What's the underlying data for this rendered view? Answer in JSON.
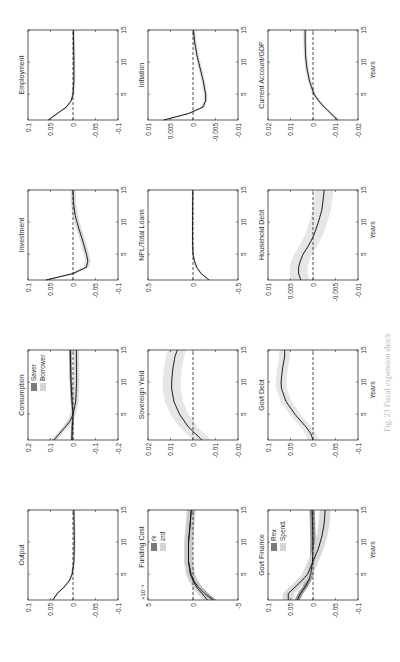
{
  "figure": {
    "caption": "Fig. 23  Fiscal expansion shock",
    "x_axis_label": "Years",
    "orientation": "rotated -90deg (landscape figure in portrait page)"
  },
  "chart_data": [
    {
      "type": "line",
      "title": "Output",
      "row": 0,
      "col": 0,
      "ylim": [
        -0.1,
        0.1
      ],
      "yticks": [
        "0.1",
        "0.05",
        "0",
        "-0.05",
        "-0.1"
      ],
      "xlim": [
        1,
        15
      ],
      "xticks": [
        "5",
        "10",
        "15"
      ],
      "series": [
        {
          "name": "Output",
          "x": [
            1,
            2,
            3,
            4,
            5,
            7,
            10,
            15
          ],
          "values": [
            0.045,
            0.035,
            0.02,
            0.008,
            0.002,
            -0.002,
            -0.003,
            -0.002
          ],
          "band": 0.003,
          "band_color": "#d8d8d8"
        }
      ]
    },
    {
      "type": "line",
      "title": "Consumption",
      "row": 0,
      "col": 1,
      "ylim": [
        -0.2,
        0.2
      ],
      "yticks": [
        "0.2",
        "0.1",
        "0",
        "-0.1",
        "-0.2"
      ],
      "xlim": [
        1,
        15
      ],
      "xticks": [
        "5",
        "10",
        "15"
      ],
      "legend": [
        {
          "label": "Saver",
          "color": "#7a7a7a"
        },
        {
          "label": "Borrower",
          "color": "#d4d4d4"
        }
      ],
      "series": [
        {
          "name": "Saver",
          "x": [
            1,
            3,
            5,
            8,
            11,
            15
          ],
          "values": [
            0.005,
            0.003,
            0.0,
            0.006,
            0.01,
            0.012
          ],
          "band": 0.006,
          "band_color": "#8a8a8a"
        },
        {
          "name": "Borrower",
          "x": [
            1,
            2,
            3,
            4,
            5,
            7,
            10,
            15
          ],
          "values": [
            0.085,
            0.06,
            0.035,
            0.012,
            0.0,
            -0.012,
            -0.016,
            -0.015
          ],
          "band": 0.012,
          "band_color": "#d4d4d4"
        }
      ]
    },
    {
      "type": "line",
      "title": "Investment",
      "row": 0,
      "col": 2,
      "ylim": [
        -0.1,
        0.1
      ],
      "yticks": [
        "0.1",
        "0.05",
        "0",
        "-0.05",
        "-0.1"
      ],
      "xlim": [
        1,
        15
      ],
      "xticks": [
        "5",
        "10",
        "15"
      ],
      "series": [
        {
          "name": "Investment",
          "x": [
            1,
            2,
            3,
            4,
            5,
            7,
            9,
            11,
            13,
            15
          ],
          "values": [
            0.06,
            0.0,
            -0.03,
            -0.033,
            -0.03,
            -0.022,
            -0.013,
            -0.005,
            -0.001,
            0.0
          ],
          "band": 0.006,
          "band_color": "#d8d8d8"
        }
      ]
    },
    {
      "type": "line",
      "title": "Employment",
      "row": 0,
      "col": 3,
      "ylim": [
        -0.1,
        0.1
      ],
      "yticks": [
        "0.1",
        "0.05",
        "0",
        "-0.05",
        "-0.1"
      ],
      "xlim": [
        1,
        15
      ],
      "xticks": [
        "5",
        "10",
        "15"
      ],
      "series": [
        {
          "name": "Employment",
          "x": [
            1,
            2,
            3,
            4,
            5,
            7,
            10,
            15
          ],
          "values": [
            0.055,
            0.035,
            0.015,
            0.004,
            0.0,
            -0.002,
            -0.002,
            -0.001
          ],
          "band": 0.003,
          "band_color": "#d8d8d8"
        }
      ]
    },
    {
      "type": "line",
      "title": "Funding Cost",
      "row": 1,
      "col": 0,
      "ylim": [
        -5,
        5
      ],
      "yticks": [
        "5",
        "0",
        "-5"
      ],
      "y_multiplier": "×10⁻³",
      "xlim": [
        1,
        15
      ],
      "xticks": [
        "5",
        "10",
        "15"
      ],
      "legend": [
        {
          "label": "rk",
          "color": "#7a7a7a"
        },
        {
          "label": "zrd",
          "color": "#d4d4d4"
        }
      ],
      "series": [
        {
          "name": "rk",
          "x": [
            1,
            2,
            3,
            4,
            5,
            7,
            10,
            13,
            15
          ],
          "values": [
            -2.2,
            -1.3,
            -0.6,
            -0.1,
            0.2,
            0.5,
            0.5,
            0.3,
            0.2
          ],
          "band": 0.4,
          "band_color": "#8a8a8a"
        },
        {
          "name": "zrd",
          "x": [
            1,
            2,
            3,
            4,
            5,
            7,
            10,
            13,
            15
          ],
          "values": [
            -1.6,
            -1.0,
            -0.4,
            0.0,
            0.3,
            0.5,
            0.5,
            0.3,
            0.2
          ],
          "band": 0.5,
          "band_color": "#d4d4d4"
        }
      ]
    },
    {
      "type": "line",
      "title": "Sovereign Yield",
      "row": 1,
      "col": 1,
      "ylim": [
        -0.02,
        0.02
      ],
      "yticks": [
        "0.02",
        "0.01",
        "0",
        "-0.01",
        "-0.02"
      ],
      "xlim": [
        1,
        15
      ],
      "xticks": [
        "5",
        "10",
        "15"
      ],
      "series": [
        {
          "name": "Sovereign Yield",
          "x": [
            1,
            2,
            3,
            4,
            5,
            7,
            9,
            10,
            12,
            14,
            15
          ],
          "values": [
            -0.004,
            -0.001,
            0.002,
            0.004,
            0.006,
            0.0085,
            0.0095,
            0.0095,
            0.009,
            0.008,
            0.007
          ],
          "band": 0.004,
          "band_color": "#e2e2e2"
        }
      ]
    },
    {
      "type": "line",
      "title": "NPL/Total Loans",
      "row": 1,
      "col": 2,
      "ylim": [
        -0.5,
        0.5
      ],
      "yticks": [
        "0.5",
        "0",
        "-0.5"
      ],
      "xlim": [
        1,
        15
      ],
      "xticks": [
        "5",
        "10",
        "15"
      ],
      "series": [
        {
          "name": "NPL/Total Loans",
          "x": [
            1,
            2,
            3,
            4,
            5,
            7,
            10,
            15
          ],
          "values": [
            -0.18,
            -0.09,
            -0.04,
            -0.015,
            0.0,
            0.005,
            0.005,
            0.003
          ],
          "band": 0.01,
          "band_color": "#d8d8d8"
        }
      ]
    },
    {
      "type": "line",
      "title": "Inflation",
      "row": 1,
      "col": 3,
      "ylim": [
        -0.01,
        0.01
      ],
      "yticks": [
        "0.01",
        "0.005",
        "0",
        "-0.005",
        "-0.01"
      ],
      "xlim": [
        1,
        15
      ],
      "xticks": [
        "5",
        "10",
        "15"
      ],
      "series": [
        {
          "name": "Inflation",
          "x": [
            1,
            2,
            3,
            4,
            5,
            7,
            9,
            11,
            13,
            15
          ],
          "values": [
            0.0065,
            0.001,
            -0.0022,
            -0.0028,
            -0.0028,
            -0.0023,
            -0.0016,
            -0.0009,
            -0.0004,
            -0.0001
          ],
          "band": 0.0004,
          "band_color": "#d8d8d8"
        }
      ]
    },
    {
      "type": "line",
      "title": "Govt Finance",
      "row": 2,
      "col": 0,
      "ylim": [
        -0.1,
        0.1
      ],
      "yticks": [
        "0.1",
        "0.05",
        "0",
        "-0.05",
        "-0.1"
      ],
      "xlim": [
        1,
        15
      ],
      "xticks": [
        "5",
        "10",
        "15"
      ],
      "legend": [
        {
          "label": "Rev.",
          "color": "#7a7a7a"
        },
        {
          "label": "Spend.",
          "color": "#d4d4d4"
        }
      ],
      "series": [
        {
          "name": "Rev.",
          "x": [
            1,
            2,
            3,
            4,
            5,
            7,
            10,
            13,
            15
          ],
          "values": [
            0.035,
            0.028,
            0.018,
            0.01,
            0.005,
            0.001,
            0.0,
            0.001,
            0.002
          ],
          "band": 0.006,
          "band_color": "#8a8a8a"
        },
        {
          "name": "Spend.",
          "x": [
            1,
            2,
            3,
            4,
            5,
            7,
            9,
            11,
            13,
            15
          ],
          "values": [
            0.055,
            0.055,
            0.04,
            0.025,
            0.012,
            0.0,
            -0.012,
            -0.02,
            -0.025,
            -0.027
          ],
          "band": 0.012,
          "band_color": "#d4d4d4"
        }
      ]
    },
    {
      "type": "line",
      "title": "Govt Debt",
      "row": 2,
      "col": 1,
      "ylim": [
        -0.1,
        0.1
      ],
      "yticks": [
        "0.1",
        "0.05",
        "0",
        "-0.05",
        "-0.1"
      ],
      "xlim": [
        1,
        15
      ],
      "xticks": [
        "5",
        "10",
        "15"
      ],
      "series": [
        {
          "name": "Govt Debt",
          "x": [
            1,
            2,
            3,
            4,
            5,
            7,
            9,
            10,
            12,
            14,
            15
          ],
          "values": [
            0.0,
            0.005,
            0.015,
            0.028,
            0.04,
            0.06,
            0.07,
            0.071,
            0.068,
            0.063,
            0.063
          ],
          "band": 0.012,
          "band_color": "#e2e2e2"
        }
      ]
    },
    {
      "type": "line",
      "title": "Household Debt",
      "row": 2,
      "col": 2,
      "ylim": [
        -0.01,
        0.01
      ],
      "yticks": [
        "0.01",
        "0.005",
        "0",
        "-0.005",
        "-0.01"
      ],
      "xlim": [
        1,
        15
      ],
      "xticks": [
        "5",
        "10",
        "15"
      ],
      "series": [
        {
          "name": "Household Debt",
          "x": [
            1,
            2,
            3,
            4,
            5,
            6,
            7,
            8,
            10,
            12,
            15
          ],
          "values": [
            0.0027,
            0.0032,
            0.0032,
            0.0028,
            0.0022,
            0.0013,
            0.0005,
            -0.0002,
            -0.0012,
            -0.002,
            -0.0025
          ],
          "band": 0.002,
          "band_color": "#e2e2e2"
        }
      ]
    },
    {
      "type": "line",
      "title": "Current Account/GDP",
      "row": 2,
      "col": 3,
      "ylim": [
        -0.02,
        0.02
      ],
      "yticks": [
        "0.02",
        "0.01",
        "0",
        "-0.01",
        "-0.02"
      ],
      "xlim": [
        1,
        15
      ],
      "xticks": [
        "5",
        "10",
        "15"
      ],
      "xlabel": "Years",
      "series": [
        {
          "name": "Current Account/GDP",
          "x": [
            1,
            2,
            3,
            4,
            5,
            7,
            9,
            11,
            13,
            15
          ],
          "values": [
            -0.011,
            -0.008,
            -0.005,
            -0.0025,
            -0.0005,
            0.0015,
            0.0027,
            0.0033,
            0.0035,
            0.0035
          ],
          "band": 0.0008,
          "band_color": "#d8d8d8"
        }
      ]
    }
  ]
}
